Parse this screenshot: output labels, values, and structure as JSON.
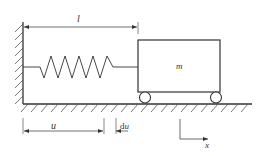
{
  "diagram": {
    "type": "mass-spring system",
    "labels": {
      "length": "l",
      "mass": "m",
      "displacement": "u",
      "increment": "du",
      "axis": "x"
    },
    "components": [
      "fixed-wall",
      "spring",
      "mass-block",
      "wheels",
      "ground",
      "dimension-l",
      "dimension-u",
      "dimension-du",
      "x-axis"
    ]
  },
  "colors": {
    "stroke": "#333333",
    "background": "#ffffff"
  }
}
